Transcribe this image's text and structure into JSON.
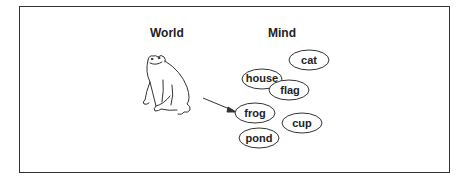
{
  "headings": {
    "world": "World",
    "mind": "Mind"
  },
  "concepts": [
    {
      "label": "cat",
      "cx": 309,
      "cy": 60,
      "rx": 20,
      "ry": 10
    },
    {
      "label": "house",
      "cx": 262,
      "cy": 79,
      "rx": 20,
      "ry": 10
    },
    {
      "label": "flag",
      "cx": 289,
      "cy": 90,
      "rx": 20,
      "ry": 10
    },
    {
      "label": "frog",
      "cx": 255,
      "cy": 113,
      "rx": 20,
      "ry": 10
    },
    {
      "label": "cup",
      "cx": 302,
      "cy": 123,
      "rx": 20,
      "ry": 10
    },
    {
      "label": "pond",
      "cx": 259,
      "cy": 138,
      "rx": 20,
      "ry": 10
    }
  ],
  "arrow": {
    "from": "frog-drawing",
    "to": "frog"
  }
}
